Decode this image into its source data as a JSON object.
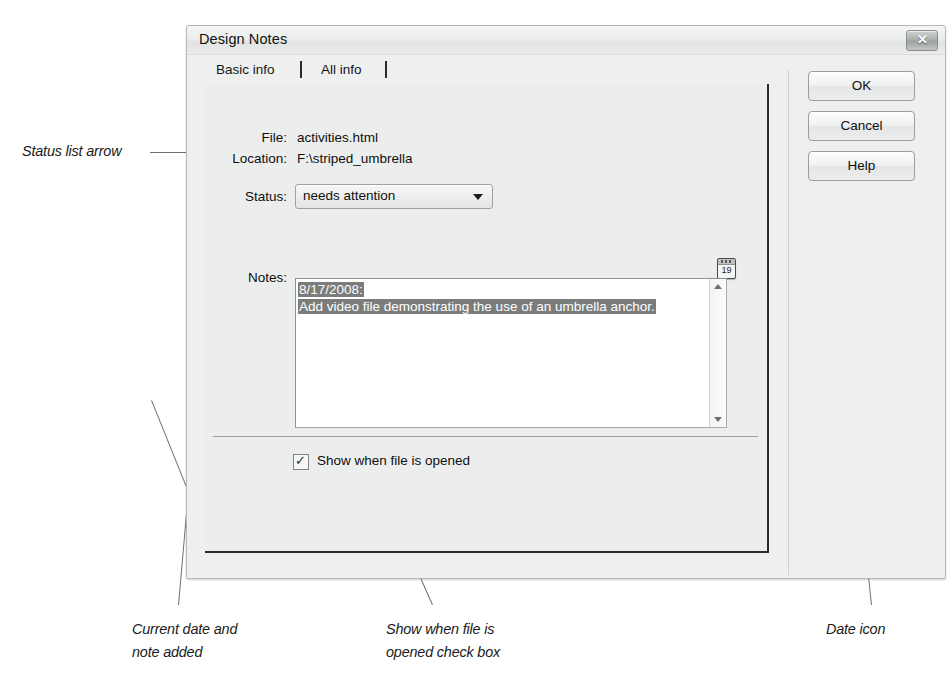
{
  "dialog": {
    "title": "Design Notes",
    "close_icon": "close-x-icon",
    "tabs": [
      {
        "label": "Basic info",
        "selected": true
      },
      {
        "label": "All info",
        "selected": false
      }
    ],
    "fields": {
      "file_label": "File:",
      "file_value": "activities.html",
      "location_label": "Location:",
      "location_value": "F:\\striped_umbrella",
      "status_label": "Status:",
      "status_value": "needs attention",
      "status_arrow_icon": "chevron-down-icon",
      "notes_label": "Notes:"
    },
    "notes": {
      "line1": "8/17/2008:",
      "line2": "Add video file demonstrating the use of an umbrella anchor.",
      "selected": true,
      "scrollbar": {
        "up_icon": "scroll-up-arrow-icon",
        "down_icon": "scroll-down-arrow-icon"
      }
    },
    "date_icon": {
      "name": "calendar-date-icon",
      "day_number": "19"
    },
    "checkbox": {
      "label": "Show when file is opened",
      "checked": true,
      "tick_glyph": "✓"
    },
    "buttons": [
      {
        "label": "OK"
      },
      {
        "label": "Cancel"
      },
      {
        "label": "Help"
      }
    ]
  },
  "annotations": {
    "status_list_arrow": "Status list arrow",
    "current_date_and_note": "Current date and\nnote added",
    "show_when_file_checkbox": "Show when file is\nopened check box",
    "date_icon": "Date icon"
  },
  "colors": {
    "dialog_bg": "#eef0ef",
    "selection_bg": "#7a7d7c",
    "frame_border": "#2b2b2b",
    "leader_line": "#6e6e6e"
  }
}
